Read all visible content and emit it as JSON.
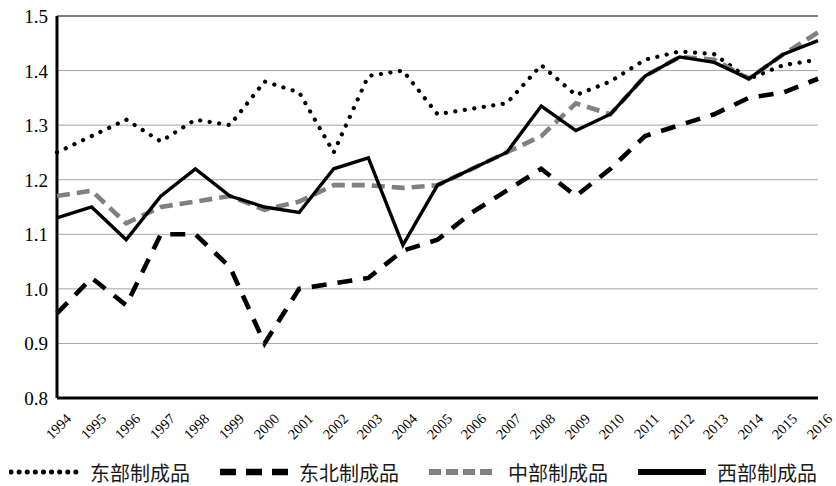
{
  "chart_data": {
    "type": "line",
    "title": "",
    "xlabel": "",
    "ylabel": "",
    "grid": true,
    "legend_position": "bottom",
    "ylim": [
      0.8,
      1.5
    ],
    "ytick_labels": [
      "1.5",
      "1.4",
      "1.3",
      "1.2",
      "1.1",
      "1.0",
      "0.9",
      "0.8"
    ],
    "ytick_values": [
      1.5,
      1.4,
      1.3,
      1.2,
      1.1,
      1.0,
      0.9,
      0.8
    ],
    "categories": [
      "1994",
      "1995",
      "1996",
      "1997",
      "1998",
      "1999",
      "2000",
      "2001",
      "2002",
      "2003",
      "2004",
      "2005",
      "2006",
      "2007",
      "2008",
      "2009",
      "2010",
      "2011",
      "2012",
      "2013",
      "2014",
      "2015",
      "2016"
    ],
    "series": [
      {
        "name": "东部制成品",
        "style": "dotted",
        "color": "#000000",
        "values": [
          1.25,
          1.28,
          1.31,
          1.27,
          1.31,
          1.3,
          1.38,
          1.36,
          1.25,
          1.39,
          1.4,
          1.32,
          1.33,
          1.34,
          1.41,
          1.355,
          1.38,
          1.42,
          1.435,
          1.43,
          1.385,
          1.41,
          1.42
        ]
      },
      {
        "name": "东北制成品",
        "style": "dashed",
        "color": "#000000",
        "values": [
          0.955,
          1.02,
          0.97,
          1.1,
          1.1,
          1.04,
          0.9,
          1.0,
          1.01,
          1.02,
          1.07,
          1.09,
          1.14,
          1.18,
          1.22,
          1.17,
          1.22,
          1.28,
          1.3,
          1.32,
          1.35,
          1.36,
          1.385
        ]
      },
      {
        "name": "中部制成品",
        "style": "dashed-gray",
        "color": "#808080",
        "values": [
          1.17,
          1.18,
          1.12,
          1.15,
          1.16,
          1.17,
          1.145,
          1.16,
          1.19,
          1.19,
          1.185,
          1.19,
          1.22,
          1.25,
          1.28,
          1.34,
          1.32,
          1.39,
          1.425,
          1.42,
          1.385,
          1.43,
          1.47
        ]
      },
      {
        "name": "西部制成品",
        "style": "solid",
        "color": "#000000",
        "values": [
          1.13,
          1.15,
          1.09,
          1.17,
          1.22,
          1.17,
          1.15,
          1.14,
          1.22,
          1.24,
          1.08,
          1.19,
          1.22,
          1.25,
          1.335,
          1.29,
          1.32,
          1.39,
          1.425,
          1.415,
          1.385,
          1.43,
          1.455
        ]
      }
    ]
  },
  "legend": {
    "items": [
      {
        "label": "东部制成品",
        "marker": "dotted-line-marker"
      },
      {
        "label": "东北制成品",
        "marker": "dashed-line-marker"
      },
      {
        "label": "中部制成品",
        "marker": "gray-dashed-line-marker"
      },
      {
        "label": "西部制成品",
        "marker": "solid-line-marker"
      }
    ]
  },
  "axes": {
    "plot_left": 57,
    "plot_right": 818,
    "plot_top": 16,
    "plot_bottom": 398
  }
}
